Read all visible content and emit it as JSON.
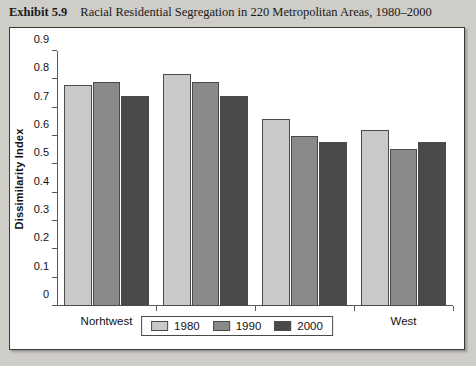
{
  "caption": {
    "exhibit_number": "Exhibit 5.9",
    "title": "Racial Residential Segregation in 220 Metropolitan Areas, 1980–2000"
  },
  "chart_data": {
    "type": "bar",
    "title": "Racial Residential Segregation in 220 Metropolitan Areas, 1980–2000",
    "xlabel": "",
    "ylabel": "Dissimilarity Index",
    "categories": [
      "Norhtwest",
      "Midwest",
      "South",
      "West"
    ],
    "series": [
      {
        "name": "1980",
        "color": "#c9c9c9",
        "values": [
          0.78,
          0.82,
          0.66,
          0.62
        ]
      },
      {
        "name": "1990",
        "color": "#8a8a8a",
        "values": [
          0.79,
          0.79,
          0.6,
          0.555
        ]
      },
      {
        "name": "2000",
        "color": "#4a4a4a",
        "values": [
          0.74,
          0.74,
          0.58,
          0.58
        ]
      }
    ],
    "ylim": [
      0,
      0.9
    ],
    "ytick_labels": [
      "0.9",
      "0.8",
      "0.7",
      "0.6",
      "0.5",
      "0.4",
      "0.3",
      "0.2",
      "0.1",
      "0"
    ],
    "ytick_values": [
      0.9,
      0.8,
      0.7,
      0.6,
      0.5,
      0.4,
      0.3,
      0.2,
      0.1,
      0
    ],
    "grid": false,
    "legend_position": "bottom"
  }
}
